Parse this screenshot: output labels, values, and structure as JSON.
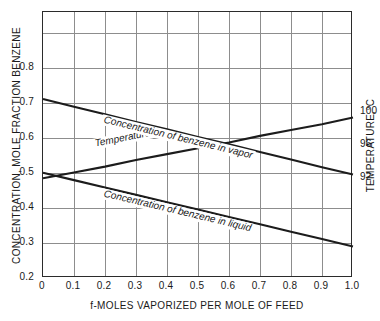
{
  "chart_data": {
    "type": "line",
    "title": "",
    "xlabel": "f-MOLES VAPORIZED PER MOLE OF FEED",
    "ylabel": "CONCENTRATION, MOLE FRACTION BENZENE",
    "y2label": "TEMPERATURE,°C",
    "grid": true,
    "legend_position": "inline-labels",
    "xlim": [
      0,
      1.0
    ],
    "xticks": [
      "0",
      "0.1",
      "0.2",
      "0.3",
      "0.4",
      "0.5",
      "0.6",
      "0.7",
      "0.8",
      "0.9",
      "1.0"
    ],
    "xtick_values": [
      0,
      0.1,
      0.2,
      0.3,
      0.4,
      0.5,
      0.6,
      0.7,
      0.8,
      0.9,
      1.0
    ],
    "ylim": [
      0.2,
      0.9583
    ],
    "yticks": [
      "0.2",
      "0.3",
      "0.4",
      "0.5",
      "0.6",
      "0.7",
      "0.8"
    ],
    "ytick_values": [
      0.2,
      0.3,
      0.4,
      0.5,
      0.6,
      0.7,
      0.8
    ],
    "y2lim": [
      80,
      112
    ],
    "y2ticks": [
      "92",
      "96",
      "100"
    ],
    "y2tick_values": [
      92,
      96,
      100
    ],
    "series": [
      {
        "name": "Temperature",
        "axis": "right",
        "units": "°C",
        "x": [
          0,
          0.1,
          0.2,
          0.3,
          0.4,
          0.5,
          0.6,
          0.7,
          0.8,
          0.9,
          1.0
        ],
        "values": [
          92.0,
          92.7,
          93.4,
          94.2,
          94.9,
          95.6,
          96.3,
          97.1,
          97.8,
          98.5,
          99.3
        ]
      },
      {
        "name": "Concentration of benzene in vapor",
        "axis": "left",
        "units": "mole fraction",
        "x": [
          0,
          0.1,
          0.2,
          0.3,
          0.4,
          0.5,
          0.6,
          0.7,
          0.8,
          0.9,
          1.0
        ],
        "values": [
          0.71,
          0.688,
          0.667,
          0.645,
          0.624,
          0.602,
          0.581,
          0.559,
          0.538,
          0.516,
          0.495
        ]
      },
      {
        "name": "Concentration of benzene in liquid",
        "axis": "left",
        "units": "mole fraction",
        "x": [
          0,
          0.1,
          0.2,
          0.3,
          0.4,
          0.5,
          0.6,
          0.7,
          0.8,
          0.9,
          1.0
        ],
        "values": [
          0.5,
          0.479,
          0.458,
          0.437,
          0.416,
          0.395,
          0.374,
          0.353,
          0.332,
          0.311,
          0.29
        ]
      }
    ],
    "annotations": [
      {
        "text": "Temperature",
        "x": 0.25,
        "y": 95.3
      },
      {
        "text": "Concentration of benzene in vapor",
        "x": 0.43,
        "y": 0.63
      },
      {
        "text": "Concentration of benzene in liquid",
        "x": 0.43,
        "y": 0.42
      }
    ]
  },
  "colors": {
    "line": "#1c1c1c",
    "grid": "#8d8d8d",
    "frame": "#2b2b2b",
    "background": "#ffffff",
    "text": "#1a1a1a"
  }
}
